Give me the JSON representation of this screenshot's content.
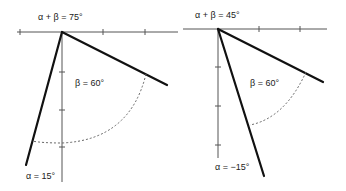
{
  "diagrams": [
    {
      "sum_label": "α + β = 75°",
      "beta_label": "β = 60°",
      "alpha_label": "α = 15°",
      "alpha_deg": 15,
      "beta_deg": 60,
      "sum_deg": 75
    },
    {
      "sum_label": "α + β = 45°",
      "beta_label": "β = 60°",
      "alpha_label": "α = −15°",
      "alpha_deg": -15,
      "beta_deg": 60,
      "sum_deg": 45
    }
  ],
  "colors": {
    "line": "#111111",
    "axis": "#555555",
    "arc": "#666666"
  }
}
